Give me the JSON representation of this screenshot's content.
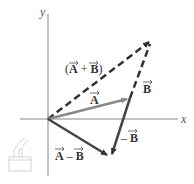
{
  "diagram": {
    "type": "vector-addition-subtraction",
    "axes": {
      "x_label": "x",
      "y_label": "y"
    },
    "origin": [
      48,
      119
    ],
    "vectors": [
      {
        "name": "A",
        "label": "A",
        "from": [
          48,
          119
        ],
        "to": [
          130,
          98
        ],
        "style": "solid",
        "color": "#8a8a8a"
      },
      {
        "name": "B",
        "label": "B",
        "from": [
          130,
          98
        ],
        "to": [
          151,
          40
        ],
        "style": "dashed",
        "color": "#333333"
      },
      {
        "name": "A_plus_B",
        "label": "(A + B)",
        "from": [
          48,
          119
        ],
        "to": [
          151,
          40
        ],
        "style": "dashed",
        "color": "#333333"
      },
      {
        "name": "minus_B",
        "label": "– B",
        "from": [
          130,
          98
        ],
        "to": [
          110,
          157
        ],
        "style": "solid",
        "color": "#444444"
      },
      {
        "name": "A_minus_B",
        "label": "A – B",
        "from": [
          48,
          119
        ],
        "to": [
          110,
          157
        ],
        "style": "solid",
        "color": "#444444"
      }
    ],
    "labels": {
      "sum": "(A + B)",
      "a": "A",
      "b": "B",
      "neg_b": "– B",
      "diff": "A – B",
      "x": "x",
      "y": "y"
    },
    "logo_icon": "sketch-logo-icon"
  }
}
